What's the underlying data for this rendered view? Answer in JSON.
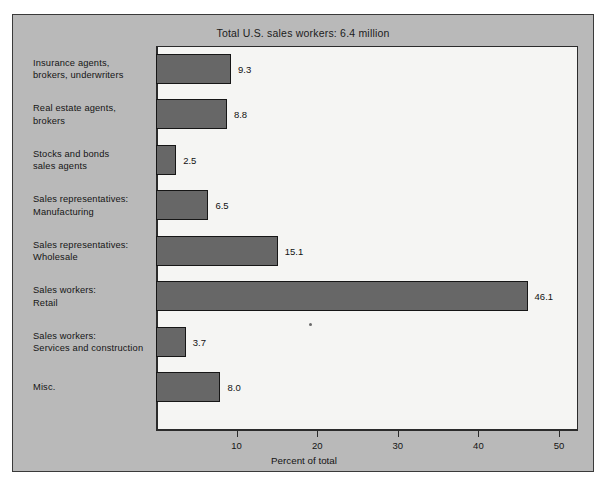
{
  "chart_data": {
    "type": "bar",
    "orientation": "horizontal",
    "title": "Total U.S. sales workers: 6.4 million",
    "xlabel": "Percent of total",
    "ylabel": "",
    "xlim": [
      0,
      50
    ],
    "xticks": [
      0,
      10,
      20,
      30,
      40,
      50
    ],
    "xtick_labels": [
      "",
      "10",
      "20",
      "30",
      "40",
      "50"
    ],
    "grid": false,
    "legend": null,
    "bar_color": "#676767",
    "plot_background": "#f5f5f3",
    "panel_background": "#b9b9b9",
    "categories": [
      "Insurance agents,\nbrokers, underwriters",
      "Real estate agents,\nbrokers",
      "Stocks and bonds\nsales agents",
      "Sales representatives:\nManufacturing",
      "Sales representatives:\nWholesale",
      "Sales workers:\nRetail",
      "Sales workers:\nServices and construction",
      "Misc."
    ],
    "values": [
      9.3,
      8.8,
      2.5,
      6.5,
      15.1,
      46.1,
      3.7,
      8.0
    ],
    "value_labels": [
      "9.3",
      "8.8",
      "2.5",
      "6.5",
      "15.1",
      "46.1",
      "3.7",
      "8.0"
    ]
  },
  "rows": [
    {
      "label_line1": "Insurance agents,",
      "label_line2": "brokers, underwriters",
      "value": 9.3,
      "value_label": "9.3"
    },
    {
      "label_line1": "Real estate agents,",
      "label_line2": "brokers",
      "value": 8.8,
      "value_label": "8.8"
    },
    {
      "label_line1": "Stocks and bonds",
      "label_line2": "sales agents",
      "value": 2.5,
      "value_label": "2.5"
    },
    {
      "label_line1": "Sales representatives:",
      "label_line2": "Manufacturing",
      "value": 6.5,
      "value_label": "6.5"
    },
    {
      "label_line1": "Sales representatives:",
      "label_line2": "Wholesale",
      "value": 15.1,
      "value_label": "15.1"
    },
    {
      "label_line1": "Sales workers:",
      "label_line2": "Retail",
      "value": 46.1,
      "value_label": "46.1"
    },
    {
      "label_line1": "Sales workers:",
      "label_line2": "Services and construction",
      "value": 3.7,
      "value_label": "3.7"
    },
    {
      "label_line1": "Misc.",
      "label_line2": "",
      "value": 8.0,
      "value_label": "8.0"
    }
  ],
  "axis": {
    "ticks": [
      {
        "value": 10,
        "label": "10"
      },
      {
        "value": 20,
        "label": "20"
      },
      {
        "value": 30,
        "label": "30"
      },
      {
        "value": 40,
        "label": "40"
      },
      {
        "value": 50,
        "label": "50"
      }
    ],
    "title": "Percent of total"
  }
}
